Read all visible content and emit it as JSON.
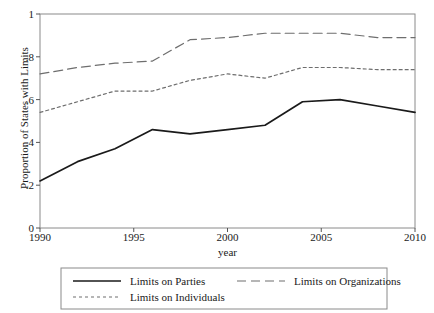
{
  "chart_data": {
    "type": "line",
    "title": "",
    "xlabel": "year",
    "ylabel": "Proportion of States with Limits",
    "xlim": [
      1990,
      2010
    ],
    "ylim": [
      0,
      1
    ],
    "grid": false,
    "legend_position": "bottom",
    "x_ticks": [
      "1990",
      "1995",
      "2000",
      "2005",
      "2010"
    ],
    "x_tick_values": [
      1990,
      1995,
      2000,
      2005,
      2010
    ],
    "y_ticks": [
      "0",
      ".2",
      ".4",
      ".6",
      ".8",
      "1"
    ],
    "y_tick_values": [
      0,
      0.2,
      0.4,
      0.6,
      0.8,
      1
    ],
    "x": [
      1990,
      1992,
      1994,
      1996,
      1998,
      2000,
      2002,
      2004,
      2006,
      2008,
      2010
    ],
    "series": [
      {
        "name": "Limits on Parties",
        "style": "solid",
        "color": "#1a1a1a",
        "values": [
          0.22,
          0.31,
          0.37,
          0.46,
          0.44,
          0.46,
          0.48,
          0.59,
          0.6,
          0.57,
          0.54
        ]
      },
      {
        "name": "Limits on Individuals",
        "style": "short-dash",
        "color": "#6e6e6e",
        "values": [
          0.54,
          0.59,
          0.64,
          0.64,
          0.69,
          0.72,
          0.7,
          0.75,
          0.75,
          0.74,
          0.74
        ]
      },
      {
        "name": "Limits on Organizations",
        "style": "long-dash",
        "color": "#6e6e6e",
        "values": [
          0.72,
          0.75,
          0.77,
          0.78,
          0.88,
          0.89,
          0.91,
          0.91,
          0.91,
          0.89,
          0.89
        ]
      }
    ]
  },
  "legend": {
    "entries": [
      {
        "label": "Limits on Parties",
        "style": "solid"
      },
      {
        "label": "Limits on Organizations",
        "style": "long-dash"
      },
      {
        "label": "Limits on Individuals",
        "style": "short-dash"
      }
    ]
  }
}
